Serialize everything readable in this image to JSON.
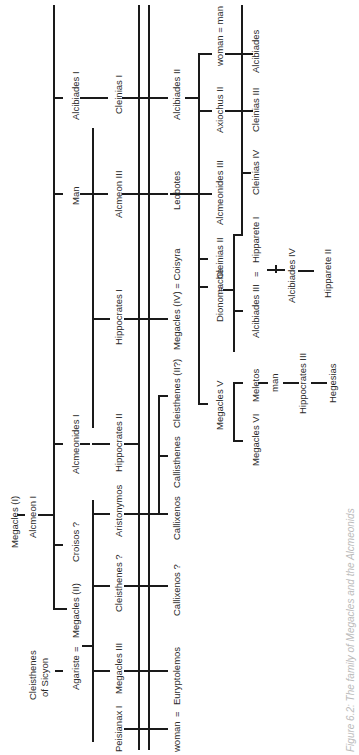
{
  "figure": {
    "caption": "Figure 6.2: The family of Megacles and the Alcmeonids",
    "orientation": "rotated 90 degrees counter-clockwise"
  },
  "people": {
    "megacles_I": "Megacles (I)",
    "alcmeon_I": "Alcmeon I",
    "cleisthenes_sicyon_1": "Cleisthenes",
    "cleisthenes_sicyon_2": "of Sicyon",
    "agariste": "Agariste",
    "eq1": "=",
    "megacles_II": "Megacles (II)",
    "croisos": "Croisos ?",
    "alcmeonides_I": "Alcmeonides I",
    "man_gen2": "Man",
    "alcibiades_I": "Alcibiades  I",
    "peisianax_I": "Peisianax I",
    "megacles_III": "Megacles III",
    "cleisthenes_q": "Cleisthenes ?",
    "aristonymos": "Aristonymos",
    "hippocrates_II": "Hippocrates II",
    "hippocrates_I": "Hippocrates I",
    "alcmeon_III": "Alcmeon III",
    "cleinias_I": "Cleinias I",
    "woman1": "woman",
    "eq2": "=",
    "euryptolemos": "Euryptolemos",
    "callixenos_q": "Callixenos ?",
    "callixenos": "Callixenos",
    "callisthenes": "Callisthenes",
    "cleisthenes_II": "Cleisthenes (II?)",
    "megacles_IV_line": "Megacles (IV) =  Coisyra",
    "leobotes": "Leobotes",
    "alcibiades_II": "Alcibiades II",
    "dionomache": "Dionomache",
    "eq3": "=",
    "cleinias_II": "Cleinias II",
    "alcmeonides_III": "Alcmeonides III",
    "axiochus_II": "Axiochus II",
    "woman_man": "woman = man",
    "megacles_V": "Megacles V",
    "alcibiades_III": "Alcibiades III",
    "eq4": "=",
    "hipparete_I": "Hipparete I",
    "cleinias_IV": "Cleinias IV",
    "cleinias_III": "Cleinias III",
    "alcibiades_last": "Alcibiades",
    "megacles_VI": "Megacles VI",
    "meletos": "Meletos",
    "man_meletos": "man",
    "hippocrates_III": "Hippocrates III",
    "hegesias": "Hegesias",
    "alcibiades_IV": "Alcibiades IV",
    "hipparete_II": "Hipparete II"
  }
}
